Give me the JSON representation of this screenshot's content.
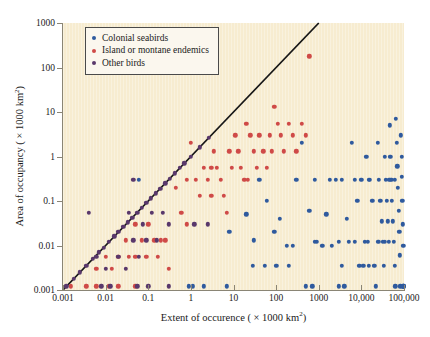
{
  "axes": {
    "x": {
      "label_prefix": "Extent of occurence ( × 1000 km",
      "label_sup": "2",
      "label_suffix": ")",
      "ticks": [
        "0.001",
        "0.01",
        "0.1",
        "1",
        "10",
        "100",
        "1000",
        "10,000",
        "100,000"
      ],
      "min": 0.001,
      "max": 100000
    },
    "y": {
      "label_prefix": "Area of occupancy ( × 1000 km",
      "label_sup": "2",
      "label_suffix": ")",
      "ticks": [
        "0.001",
        "0.01",
        "0.1",
        "1",
        "10",
        "100",
        "1000"
      ],
      "min": 0.001,
      "max": 1000
    }
  },
  "legend": {
    "items": [
      {
        "label": "Colonial seabirds",
        "color": "#2f5a9e"
      },
      {
        "label": "Island or montane endemics",
        "color": "#cf4a47"
      },
      {
        "label": "Other birds",
        "color": "#59386b"
      }
    ]
  },
  "colors": {
    "panel": "#f7ecd0",
    "axis": "#8a8575",
    "identity_line": "#161616",
    "blue": "#2f5a9e",
    "red": "#cf4a47",
    "purple": "#59386b"
  },
  "chart_data": {
    "type": "scatter",
    "title": "",
    "xlabel": "Extent of occurence ( × 1000 km2)",
    "ylabel": "Area of occupancy ( × 1000 km2)",
    "xscale": "log",
    "yscale": "log",
    "xlim": [
      0.001,
      100000
    ],
    "ylim": [
      0.001,
      1000
    ],
    "grid": false,
    "legend_position": "top-left",
    "annotations": [
      {
        "type": "line",
        "name": "identity-line",
        "x": [
          0.001,
          1000
        ],
        "y": [
          0.001,
          1000
        ]
      }
    ],
    "series": [
      {
        "name": "Colonial seabirds",
        "color": "#2f5a9e",
        "points": [
          [
            0.06,
            0.3
          ],
          [
            0.9,
            0.0012
          ],
          [
            1.1,
            0.0012
          ],
          [
            2.0,
            0.0012
          ],
          [
            7.0,
            0.0012
          ],
          [
            8.0,
            0.02
          ],
          [
            20,
            0.05
          ],
          [
            30,
            0.013
          ],
          [
            40,
            0.3
          ],
          [
            60,
            0.1
          ],
          [
            90,
            0.02
          ],
          [
            120,
            0.04
          ],
          [
            180,
            0.01
          ],
          [
            250,
            0.01
          ],
          [
            300,
            0.3
          ],
          [
            400,
            2.0
          ],
          [
            500,
            0.0012
          ],
          [
            700,
            0.0012
          ],
          [
            600,
            0.06
          ],
          [
            800,
            0.3
          ],
          [
            900,
            0.012
          ],
          [
            1200,
            0.01
          ],
          [
            1500,
            0.05
          ],
          [
            2000,
            0.01
          ],
          [
            2500,
            0.3
          ],
          [
            3000,
            0.012
          ],
          [
            3500,
            0.0035
          ],
          [
            3000,
            0.0012
          ],
          [
            4000,
            0.0012
          ],
          [
            4500,
            0.04
          ],
          [
            5000,
            0.012
          ],
          [
            6000,
            2.0
          ],
          [
            7000,
            0.3
          ],
          [
            8000,
            0.1
          ],
          [
            9000,
            0.0035
          ],
          [
            10000,
            0.3
          ],
          [
            11000,
            0.0035
          ],
          [
            12000,
            0.012
          ],
          [
            13000,
            1.0
          ],
          [
            14000,
            0.012
          ],
          [
            15000,
            0.0035
          ],
          [
            16000,
            0.3
          ],
          [
            18000,
            0.1
          ],
          [
            20000,
            0.0035
          ],
          [
            22000,
            0.0012
          ],
          [
            24000,
            2.0
          ],
          [
            26000,
            0.3
          ],
          [
            28000,
            0.1
          ],
          [
            30000,
            0.035
          ],
          [
            32000,
            0.012
          ],
          [
            34000,
            0.0035
          ],
          [
            36000,
            1.0
          ],
          [
            38000,
            0.3
          ],
          [
            40000,
            0.1
          ],
          [
            42000,
            0.035
          ],
          [
            44000,
            0.012
          ],
          [
            46000,
            5.0
          ],
          [
            48000,
            1.0
          ],
          [
            50000,
            0.3
          ],
          [
            52000,
            0.1
          ],
          [
            55000,
            0.035
          ],
          [
            58000,
            0.012
          ],
          [
            60000,
            0.0035
          ],
          [
            62000,
            0.0012
          ],
          [
            65000,
            7.0
          ],
          [
            68000,
            2.0
          ],
          [
            70000,
            0.6
          ],
          [
            72000,
            0.2
          ],
          [
            75000,
            0.06
          ],
          [
            78000,
            0.02
          ],
          [
            80000,
            0.006
          ],
          [
            82000,
            0.0012
          ],
          [
            85000,
            3.0
          ],
          [
            88000,
            1.0
          ],
          [
            90000,
            0.35
          ],
          [
            92000,
            0.1
          ],
          [
            94000,
            0.03
          ],
          [
            96000,
            0.01
          ],
          [
            98000,
            0.0012
          ],
          [
            99000,
            0.0012
          ],
          [
            97000,
            0.0012
          ],
          [
            95000,
            0.0012
          ],
          [
            60000,
            0.3
          ],
          [
            45000,
            0.3
          ],
          [
            35000,
            0.012
          ],
          [
            25000,
            0.012
          ],
          [
            15000,
            0.3
          ],
          [
            7000,
            0.012
          ],
          [
            3500,
            0.3
          ],
          [
            1800,
            0.3
          ],
          [
            800,
            0.012
          ],
          [
            200,
            0.0035
          ],
          [
            100,
            0.0035
          ],
          [
            55,
            0.0035
          ],
          [
            28,
            0.0035
          ]
        ]
      },
      {
        "name": "Island or montane endemics",
        "color": "#cf4a47",
        "points": [
          [
            0.0015,
            0.0012
          ],
          [
            0.0035,
            0.0012
          ],
          [
            0.006,
            0.003
          ],
          [
            0.006,
            0.0012
          ],
          [
            0.01,
            0.0055
          ],
          [
            0.014,
            0.003
          ],
          [
            0.02,
            0.0055
          ],
          [
            0.02,
            0.0012
          ],
          [
            0.03,
            0.013
          ],
          [
            0.035,
            0.0055
          ],
          [
            0.05,
            0.03
          ],
          [
            0.05,
            0.0055
          ],
          [
            0.07,
            0.013
          ],
          [
            0.1,
            0.03
          ],
          [
            0.14,
            0.013
          ],
          [
            0.2,
            0.013
          ],
          [
            0.3,
            0.003
          ],
          [
            0.45,
            0.2
          ],
          [
            0.6,
            0.055
          ],
          [
            0.8,
            0.03
          ],
          [
            1.0,
            2.0
          ],
          [
            1.3,
            0.3
          ],
          [
            1.6,
            0.13
          ],
          [
            2.0,
            0.55
          ],
          [
            2.5,
            0.3
          ],
          [
            3.0,
            0.13
          ],
          [
            3.5,
            1.3
          ],
          [
            4.0,
            0.55
          ],
          [
            5.0,
            0.3
          ],
          [
            6.0,
            0.13
          ],
          [
            7.0,
            0.055
          ],
          [
            8.0,
            1.3
          ],
          [
            9.0,
            0.55
          ],
          [
            11,
            3.0
          ],
          [
            13,
            1.3
          ],
          [
            15,
            0.55
          ],
          [
            18,
            0.3
          ],
          [
            20,
            5.5
          ],
          [
            25,
            3.0
          ],
          [
            30,
            1.3
          ],
          [
            35,
            0.55
          ],
          [
            40,
            3.0
          ],
          [
            50,
            1.3
          ],
          [
            60,
            0.55
          ],
          [
            70,
            3.0
          ],
          [
            80,
            1.3
          ],
          [
            90,
            13
          ],
          [
            110,
            5.5
          ],
          [
            130,
            3.0
          ],
          [
            150,
            1.3
          ],
          [
            200,
            5.5
          ],
          [
            250,
            3.0
          ],
          [
            300,
            1.3
          ],
          [
            400,
            5.5
          ],
          [
            500,
            3.0
          ],
          [
            600,
            180
          ],
          [
            0.25,
            0.013
          ],
          [
            0.05,
            0.0012
          ],
          [
            0.012,
            0.0012
          ],
          [
            0.09,
            0.0055
          ],
          [
            0.17,
            0.0055
          ],
          [
            0.8,
            0.3
          ],
          [
            3.0,
            0.55
          ],
          [
            22,
            0.3
          ]
        ]
      },
      {
        "name": "Other birds",
        "color": "#59386b",
        "points": [
          [
            0.0012,
            0.0012
          ],
          [
            0.0018,
            0.0018
          ],
          [
            0.0025,
            0.0025
          ],
          [
            0.0035,
            0.0035
          ],
          [
            0.005,
            0.005
          ],
          [
            0.007,
            0.007
          ],
          [
            0.009,
            0.009
          ],
          [
            0.012,
            0.012
          ],
          [
            0.016,
            0.016
          ],
          [
            0.02,
            0.02
          ],
          [
            0.026,
            0.026
          ],
          [
            0.033,
            0.033
          ],
          [
            0.042,
            0.042
          ],
          [
            0.055,
            0.055
          ],
          [
            0.07,
            0.07
          ],
          [
            0.09,
            0.09
          ],
          [
            0.115,
            0.115
          ],
          [
            0.15,
            0.15
          ],
          [
            0.19,
            0.19
          ],
          [
            0.25,
            0.25
          ],
          [
            0.32,
            0.32
          ],
          [
            0.42,
            0.42
          ],
          [
            0.55,
            0.55
          ],
          [
            0.7,
            0.7
          ],
          [
            1.0,
            1.0
          ],
          [
            1.6,
            1.6
          ],
          [
            2.6,
            2.6
          ],
          [
            0.004,
            0.055
          ],
          [
            0.01,
            0.003
          ],
          [
            0.013,
            0.0012
          ],
          [
            0.02,
            0.0055
          ],
          [
            0.03,
            0.003
          ],
          [
            0.035,
            0.055
          ],
          [
            0.045,
            0.013
          ],
          [
            0.06,
            0.0055
          ],
          [
            0.075,
            0.03
          ],
          [
            0.09,
            0.013
          ],
          [
            0.12,
            0.055
          ],
          [
            0.16,
            0.013
          ],
          [
            0.22,
            0.055
          ],
          [
            0.3,
            0.03
          ],
          [
            0.1,
            0.0012
          ],
          [
            0.055,
            0.0012
          ],
          [
            1.2,
            0.03
          ],
          [
            2.5,
            0.03
          ],
          [
            0.006,
            0.0055
          ],
          [
            0.045,
            0.3
          ],
          [
            0.3,
            0.0012
          ],
          [
            0.008,
            0.0012
          ]
        ]
      }
    ]
  }
}
